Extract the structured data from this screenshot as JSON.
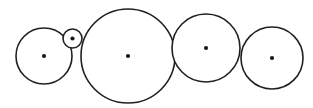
{
  "figure": {
    "type": "geometric-diagram",
    "canvas": {
      "width": 313,
      "height": 108
    },
    "style": {
      "background_color": "#ffffff",
      "stroke_color": "#231f20",
      "stroke_width": 1.6,
      "fill_color": "#ffffff",
      "center_dot_color": "#171717",
      "center_dot_radius": 2.1
    },
    "circles": [
      {
        "id": "circle-1",
        "label": "first circle",
        "cx": 44,
        "cy": 56,
        "r": 28,
        "has_center_dot": true,
        "order": 1
      },
      {
        "id": "circle-2",
        "label": "small circle",
        "cx": 72.5,
        "cy": 38.5,
        "r": 9.5,
        "has_center_dot": true,
        "order": 2
      },
      {
        "id": "circle-3",
        "label": "largest circle",
        "cx": 128,
        "cy": 56,
        "r": 47,
        "has_center_dot": true,
        "order": 3
      },
      {
        "id": "circle-4",
        "label": "fourth circle",
        "cx": 206,
        "cy": 48,
        "r": 34,
        "has_center_dot": true,
        "order": 4
      },
      {
        "id": "circle-5",
        "label": "fifth circle",
        "cx": 272,
        "cy": 58,
        "r": 31,
        "has_center_dot": true,
        "order": 5
      }
    ]
  }
}
